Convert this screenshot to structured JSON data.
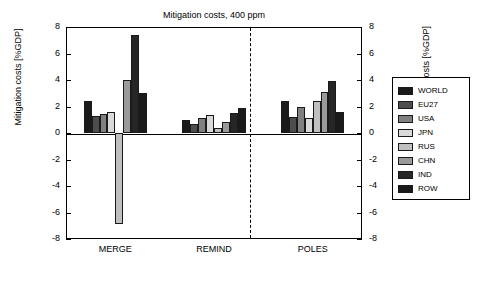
{
  "chart_data": {
    "type": "bar",
    "title": "Mitigation costs, 400 ppm",
    "ylabel": "Mitigation costs [%GDP]",
    "ylabel_right": "Abatement costs [%GDP]",
    "xlabel": "",
    "ylim": [
      -8,
      8
    ],
    "yticks": [
      -8,
      -6,
      -4,
      -2,
      0,
      2,
      4,
      6,
      8
    ],
    "yticks_right": [
      -8,
      -6,
      -4,
      -2,
      0,
      2,
      4,
      6,
      8
    ],
    "grid": false,
    "legend_position": "right-outside",
    "categories": [
      "MERGE",
      "REMIND",
      "POLES"
    ],
    "legend": [
      "WORLD",
      "EU27",
      "USA",
      "JPN",
      "RUS",
      "CHN",
      "IND",
      "ROW"
    ],
    "series": [
      {
        "name": "WORLD",
        "color": "#1a1a1a",
        "values": [
          2.4,
          1.0,
          2.4
        ]
      },
      {
        "name": "EU27",
        "color": "#4d4d4d",
        "values": [
          1.3,
          0.7,
          1.2
        ]
      },
      {
        "name": "USA",
        "color": "#808080",
        "values": [
          1.4,
          1.1,
          2.0
        ]
      },
      {
        "name": "JPN",
        "color": "#d9d9d9",
        "values": [
          1.6,
          1.35,
          1.1
        ]
      },
      {
        "name": "RUS",
        "color": "#bfbfbf",
        "values": [
          -6.9,
          0.35,
          2.4
        ]
      },
      {
        "name": "CHN",
        "color": "#9a9a9a",
        "values": [
          4.0,
          0.85,
          3.1
        ]
      },
      {
        "name": "IND",
        "color": "#262626",
        "values": [
          7.4,
          1.5,
          3.9
        ]
      },
      {
        "name": "ROW",
        "color": "#1a1a1a",
        "values": [
          3.0,
          1.85,
          1.6
        ]
      }
    ]
  }
}
